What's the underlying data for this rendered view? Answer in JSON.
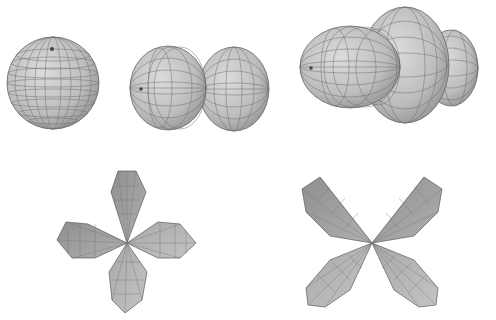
{
  "figure": {
    "background": "#ffffff",
    "surface_fill": "#b9b9b9",
    "surface_light": "#d8d8d8",
    "mesh_stroke": "#6a6a6a",
    "outline_stroke": "#555555",
    "panels": [
      {
        "id": "s-orbital",
        "shape": "sphere",
        "description": "single sphere with pole at top"
      },
      {
        "id": "p-orbital",
        "shape": "two-lobe dumbbell",
        "description": "two spheres side by side along horizontal axis"
      },
      {
        "id": "dz2-orbital",
        "shape": "dumbbell with torus",
        "description": "two lobes along horizontal axis with a ring around the middle"
      },
      {
        "id": "d-orbital-axes",
        "shape": "four-lobe cloverleaf",
        "description": "four faceted lobes along vertical and horizontal axes"
      },
      {
        "id": "d-orbital-diagonal",
        "shape": "four-lobe cloverleaf rotated 45°",
        "description": "four faceted lobes along diagonals"
      }
    ]
  }
}
